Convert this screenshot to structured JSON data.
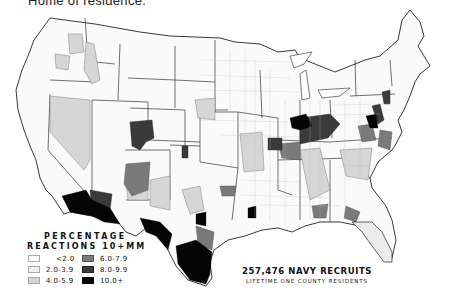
{
  "top_caption": "Home of residence.",
  "legend": {
    "title_line1": "PERCENTAGE",
    "title_line2": "REACTIONS 10+MM",
    "items": [
      {
        "label": "<2.0",
        "color": "#ffffff"
      },
      {
        "label": "2.0-3.9",
        "color": "#f2f2f2"
      },
      {
        "label": "4.0-5.9",
        "color": "#d6d6d6"
      },
      {
        "label": "6.0-7.9",
        "color": "#7a7a7a"
      },
      {
        "label": "8.0-9.9",
        "color": "#3a3a3a"
      },
      {
        "label": "10.0+",
        "color": "#050505"
      }
    ]
  },
  "caption": {
    "line1": "257,476 NAVY RECRUITS",
    "line2": "LIFETIME ONE COUNTY RESIDENTS"
  },
  "map": {
    "subject": "United States county-level choropleth",
    "region_shading": {
      "southwest_arizona": "10.0+",
      "west_texas_rio_grande": "10.0+",
      "south_texas_gulf": "10.0+",
      "colorado_central": "8.0-9.9",
      "new_mexico_northwest": "6.0-7.9",
      "kentucky_tennessee": "8.0-9.9",
      "virginia_carolina_coast": "8.0-9.9",
      "nevada": "4.0-5.9",
      "idaho": "4.0-5.9",
      "new_mexico_east": "4.0-5.9"
    }
  }
}
